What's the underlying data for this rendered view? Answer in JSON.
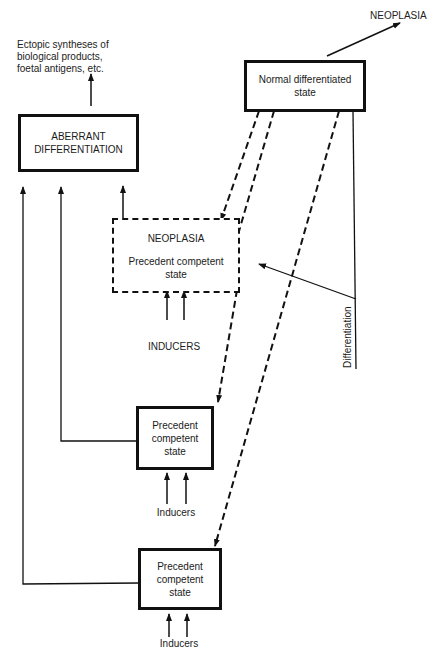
{
  "diagram": {
    "nodes": {
      "normal": {
        "label": "Normal differentiated state"
      },
      "aberrant": {
        "line1": "ABERRANT",
        "line2": "DIFFERENTIATION"
      },
      "neoplasia_box": {
        "title": "NEOPLASIA",
        "line1": "Precedent competent",
        "line2": "state"
      },
      "precedent_mid": {
        "line1": "Precedent",
        "line2": "competent",
        "line3": "state"
      },
      "precedent_bottom": {
        "line1": "Precedent",
        "line2": "competent",
        "line3": "state"
      }
    },
    "labels": {
      "neoplasia_top": "NEOPLASIA",
      "ectopic_line1": "Ectopic syntheses of",
      "ectopic_line2": "biological products,",
      "ectopic_line3": "foetal antigens, etc.",
      "inducers_caps": "INDUCERS",
      "inducers_mid": "Inducers",
      "inducers_bottom": "Inducers",
      "differentiation": "Differentiation"
    },
    "edges": [
      {
        "from": "normal",
        "to": "neoplasia_top",
        "style": "solid"
      },
      {
        "from": "aberrant",
        "to": "ectopic",
        "style": "solid"
      },
      {
        "from": "normal",
        "to": "neoplasia_box",
        "style": "dashed"
      },
      {
        "from": "normal",
        "to": "precedent_mid",
        "style": "dashed"
      },
      {
        "from": "normal",
        "to": "precedent_bottom",
        "style": "dashed"
      },
      {
        "from": "neoplasia_box",
        "to": "aberrant",
        "style": "solid"
      },
      {
        "from": "precedent_mid",
        "to": "aberrant",
        "style": "solid"
      },
      {
        "from": "precedent_bottom",
        "to": "aberrant",
        "style": "solid"
      },
      {
        "from": "inducers_caps",
        "to": "neoplasia_box",
        "style": "solid"
      },
      {
        "from": "inducers_mid",
        "to": "precedent_mid",
        "style": "solid"
      },
      {
        "from": "inducers_bottom",
        "to": "precedent_bottom",
        "style": "solid"
      },
      {
        "from": "differentiation",
        "to": "neoplasia_box",
        "style": "solid"
      }
    ]
  }
}
